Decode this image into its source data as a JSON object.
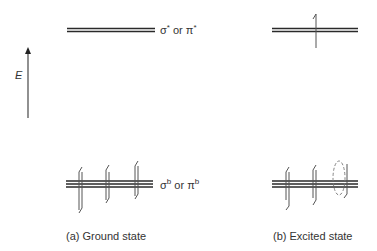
{
  "diagram": {
    "energy_axis": {
      "label": "E",
      "direction": "up"
    },
    "levels": {
      "antibonding": {
        "label_main": "σ",
        "label_sup": "*",
        "label_or": " or ",
        "label_main2": "π",
        "label_sup2": "*"
      },
      "bonding": {
        "label_main": "σ",
        "label_sup": "b",
        "label_or": " or ",
        "label_main2": "π",
        "label_sup2": "b"
      }
    },
    "panels": [
      {
        "id": "a",
        "caption": "(a)  Ground state",
        "antibonding_electrons": 0,
        "bonding_pairs": 3,
        "bonding_electrons": [
          "up-down",
          "up-down",
          "up-down"
        ]
      },
      {
        "id": "b",
        "caption": "(b)  Excited state",
        "antibonding_electrons": 1,
        "antibonding_spin": "up",
        "bonding_pairs": 2,
        "bonding_electrons": [
          "up-down",
          "up-down",
          "down (hole marked with dashed ellipse)"
        ]
      }
    ],
    "colors": {
      "line": "#2a2a2a",
      "arrow": "#555555",
      "dashed": "#777777",
      "background": "#ffffff"
    }
  }
}
